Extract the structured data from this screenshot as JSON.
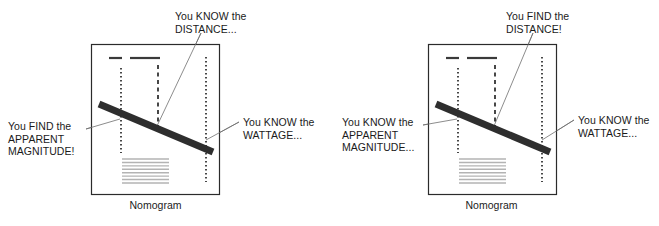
{
  "figure": {
    "panel_count": 2
  },
  "colors": {
    "background": "#ffffff",
    "box_border": "#2b2b2b",
    "bar": "#2e2e2e",
    "dotted_axis": "#1a1a1a",
    "leader_line": "#6f6f6f",
    "hatch_lines": "#b3b3b3",
    "dash_marks": "#3a3a3a",
    "text": "#1b1b1b"
  },
  "panels": [
    {
      "id": "left",
      "caption": "Nomogram",
      "callouts": {
        "top": "You KNOW the\nDISTANCE...",
        "left": "You FIND the\nAPPARENT\nMAGNITUDE!",
        "right": "You KNOW the\nWATTAGE..."
      },
      "box": {
        "x": 91,
        "y": 44,
        "w": 128,
        "h": 150
      },
      "axes": [
        {
          "name": "apparent-magnitude-axis",
          "x": 121,
          "y1": 68,
          "y2": 153
        },
        {
          "name": "distance-axis",
          "x": 158,
          "y1": 65,
          "y2": 127
        },
        {
          "name": "wattage-axis",
          "x": 206,
          "y1": 57,
          "y2": 182
        }
      ],
      "bar": {
        "x1": 99,
        "y1": 104,
        "x2": 213,
        "y2": 152,
        "thickness": 7
      },
      "dash_marks": [
        {
          "x1": 109,
          "y1": 58,
          "x2": 122,
          "y2": 58
        },
        {
          "x1": 130,
          "y1": 58,
          "x2": 160,
          "y2": 58
        }
      ],
      "hatch_block": {
        "x": 122,
        "y": 159,
        "w": 47,
        "h": 24,
        "lines": 8
      },
      "leaders": [
        {
          "name": "leader-distance",
          "x1": 201,
          "y1": 33,
          "x2": 157,
          "y2": 126
        },
        {
          "name": "leader-magnitude",
          "x1": 86,
          "y1": 129,
          "x2": 120,
          "y2": 119
        },
        {
          "name": "leader-wattage",
          "x1": 239,
          "y1": 122,
          "x2": 206,
          "y2": 140
        }
      ]
    },
    {
      "id": "right",
      "caption": "Nomogram",
      "callouts": {
        "top": "You FIND the\nDISTANCE!",
        "left": "You KNOW the\nAPPARENT\nMAGNITUDE...",
        "right": "You KNOW the\nWATTAGE..."
      },
      "box": {
        "x": 98,
        "y": 44,
        "w": 128,
        "h": 150
      },
      "axes": [
        {
          "name": "apparent-magnitude-axis",
          "x": 128,
          "y1": 68,
          "y2": 153
        },
        {
          "name": "distance-axis",
          "x": 165,
          "y1": 65,
          "y2": 127
        },
        {
          "name": "wattage-axis",
          "x": 212,
          "y1": 57,
          "y2": 182
        }
      ],
      "bar": {
        "x1": 106,
        "y1": 104,
        "x2": 220,
        "y2": 152,
        "thickness": 7
      },
      "dash_marks": [
        {
          "x1": 116,
          "y1": 58,
          "x2": 129,
          "y2": 58
        },
        {
          "x1": 137,
          "y1": 58,
          "x2": 167,
          "y2": 58
        }
      ],
      "hatch_block": {
        "x": 129,
        "y": 159,
        "w": 47,
        "h": 24,
        "lines": 8
      },
      "leaders": [
        {
          "name": "leader-distance",
          "x1": 203,
          "y1": 33,
          "x2": 164,
          "y2": 126
        },
        {
          "name": "leader-magnitude",
          "x1": 93,
          "y1": 125,
          "x2": 127,
          "y2": 119
        },
        {
          "name": "leader-wattage",
          "x1": 244,
          "y1": 120,
          "x2": 212,
          "y2": 140
        }
      ]
    }
  ]
}
